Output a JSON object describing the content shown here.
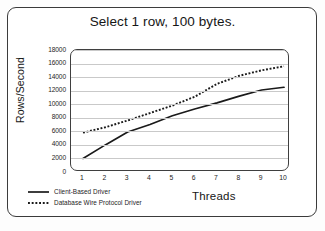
{
  "chart_data": {
    "type": "line",
    "title": "Select 1 row, 100 bytes.",
    "xlabel": "Threads",
    "ylabel": "Rows/Second",
    "x": [
      1,
      2,
      3,
      4,
      5,
      6,
      7,
      8,
      9,
      10
    ],
    "xticklabels": [
      "1",
      "2",
      "3",
      "4",
      "5",
      "6",
      "7",
      "8",
      "9",
      "10"
    ],
    "yticklabels": [
      "18000",
      "16000",
      "14000",
      "12000",
      "10000",
      "8000",
      "6000",
      "4000",
      "2000",
      "0"
    ],
    "yticks": [
      18000,
      16000,
      14000,
      12000,
      10000,
      8000,
      6000,
      4000,
      2000,
      0
    ],
    "ylim": [
      0,
      18000
    ],
    "xlim": [
      1,
      10
    ],
    "grid": true,
    "grid_axis": "y",
    "legend_position": "bottom-left",
    "series": [
      {
        "name": "Client-Based Driver",
        "style": "solid",
        "color": "#1a1a1a",
        "values": [
          2000,
          4000,
          5900,
          7000,
          8300,
          9300,
          10200,
          11200,
          12100,
          12500
        ]
      },
      {
        "name": "Database Wire Protocol Driver",
        "style": "dotted",
        "color": "#1a1a1a",
        "values": [
          5800,
          6600,
          7600,
          8700,
          9800,
          11100,
          13000,
          14200,
          15000,
          15600
        ]
      }
    ]
  },
  "figure": {
    "background": "#ffffff",
    "frame_color": "#3b3b3b",
    "gridline_color": "#c9c9c9"
  }
}
